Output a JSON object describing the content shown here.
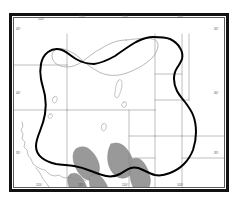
{
  "figure": {
    "kind": "map",
    "title": "",
    "caption": "",
    "projection_note": "western United States regional map",
    "frame": {
      "outer_border_color": "#111111",
      "inner_border_color": "#5a5a5a"
    }
  },
  "map_style": {
    "background": "#ffffff",
    "political_boundary_color": "#8a8a8a",
    "coastline_color": "#8a8a8a",
    "lake_outline_color": "#8a8a8a",
    "study_region_color": "#000000",
    "secondary_region_color": "#9a9a9a",
    "shaded_region_fill": "#999999",
    "shaded_region_stroke": "#7a7a7a"
  },
  "layers": [
    {
      "name": "state-boundaries",
      "label": "State boundaries",
      "style": "thin gray lines"
    },
    {
      "name": "coastline",
      "label": "Coastline",
      "style": "thin gray line"
    },
    {
      "name": "lakes",
      "label": "Lakes",
      "style": "thin gray outlines"
    },
    {
      "name": "study-region-outline",
      "label": "Study region outline",
      "style": "thick black closed curve"
    },
    {
      "name": "secondary-region-outline",
      "label": "Secondary region outline",
      "style": "thin gray closed curve"
    },
    {
      "name": "shaded-regions",
      "label": "Shaded regions",
      "style": "medium gray filled polygons"
    }
  ],
  "axis_labels": {
    "top": [
      {
        "text": "120°",
        "x": 38,
        "y": 18
      },
      {
        "text": "115°",
        "x": 79,
        "y": 16
      },
      {
        "text": "110°",
        "x": 122,
        "y": 16
      },
      {
        "text": "105°",
        "x": 177,
        "y": 16
      }
    ],
    "bottom": [
      {
        "text": "120°",
        "x": 36,
        "y": 184
      },
      {
        "text": "115°",
        "x": 78,
        "y": 184
      },
      {
        "text": "110°",
        "x": 122,
        "y": 184
      },
      {
        "text": "105°",
        "x": 177,
        "y": 184
      }
    ],
    "left": [
      {
        "text": "45°",
        "x": 16,
        "y": 28
      },
      {
        "text": "40°",
        "x": 16,
        "y": 92
      },
      {
        "text": "35°",
        "x": 16,
        "y": 152
      }
    ],
    "right": [
      {
        "text": "45°",
        "x": 214,
        "y": 28
      },
      {
        "text": "40°",
        "x": 214,
        "y": 92
      },
      {
        "text": "35°",
        "x": 214,
        "y": 152
      }
    ]
  },
  "geometry": {
    "state_boundaries": [
      "M 0 47 L 53 47",
      "M 53 47 L 53 16",
      "M 53 47 L 53 92",
      "M 0 92 L 53 92",
      "M 53 92 L 141 92",
      "M 141 16 L 141 92",
      "M 141 92 L 141 118",
      "M 141 118 L 212 118",
      "M 141 118 L 141 171",
      "M 115 118 L 141 118",
      "M 115 92 L 115 171",
      "M 53 92 L 53 171",
      "M 168 16 L 168 118",
      "M 168 118 L 168 171",
      "M 141 56 L 168 56",
      "M 141 82 L 175 82",
      "M 175 82 L 175 16",
      "M 115 140 L 141 140",
      "M 168 140 L 212 140"
    ],
    "coastline": "M 8 104 L 9 108 L 7 112 L 9 116 L 8 121 L 11 124 L 10 129 L 13 132 L 14 137 L 17 141 L 19 146 L 23 149 L 27 151 L 31 152 L 34 155 L 37 157 L 41 158 L 45 157 L 48 159 L 52 160 L 56 159 L 60 161 L 64 162 L 68 161 L 72 163",
    "gulf_line": "M 22 150 L 26 155 L 29 161 L 33 166 L 36 171",
    "lakes": [
      "M 104 63 C 106 60 108 62 108 66 C 108 71 106 76 104 79 C 102 81 100 79 101 74 C 102 69 102 65 104 63 Z",
      "M 110 84 C 112 83 113 85 112 88 C 111 90 109 90 108 88 C 107 86 108 85 110 84 Z",
      "M 40 79 C 42 77 44 79 43 82 C 42 85 40 86 39 84 C 38 82 38 80 40 79 Z",
      "M 36 96 C 38 95 39 97 38 99 C 37 101 35 101 34 99 C 34 97 35 96 36 96 Z",
      "M 89 106 C 91 104 93 106 92 110 C 91 113 89 114 88 112 C 87 109 87 107 89 106 Z"
    ],
    "secondary_region": "M 112 22 C 104 22 96 25 88 30 C 80 34 73 40 68 44 C 63 47 58 49 53 49 C 48 49 44 47 41 45 C 39 43 38 40 38 37 C 38 34 40 32 43 31 C 47 30 51 31 55 33 C 60 35 65 39 69 43 C 74 47 79 51 85 54 C 91 57 98 58 105 57 C 112 56 118 53 124 50 C 130 47 135 43 139 39 C 142 35 144 31 144 27 C 144 24 142 22 139 21 C 134 20 128 20 122 21 C 118 21 115 22 112 22 Z",
    "study_region": "M 139 19 C 134 19 128 21 122 24 C 115 28 108 33 101 38 C 94 42 87 45 80 46 C 73 46 67 44 62 41 C 57 38 53 34 48 32 C 43 30 38 31 34 34 C 30 37 28 41 27 46 C 26 51 26 56 27 61 C 28 67 30 72 31 78 C 32 84 32 90 31 96 C 30 102 28 108 26 113 C 24 118 22 123 22 128 C 22 133 24 137 28 140 C 32 143 37 145 42 146 C 48 147 54 147 60 148 C 66 149 72 151 77 153 C 82 155 87 157 92 158 C 97 159 102 158 106 156 C 110 154 113 151 117 150 C 121 149 125 150 129 152 C 133 154 137 156 141 157 C 146 158 151 157 156 155 C 161 153 166 150 170 146 C 174 142 177 137 179 132 C 181 126 182 120 182 114 C 182 108 181 102 179 97 C 177 92 174 88 171 84 C 168 80 165 77 163 73 C 161 69 160 65 160 61 C 160 57 161 53 163 50 C 165 47 167 44 168 41 C 169 37 168 33 166 30 C 164 26 160 23 156 21 C 151 19 145 19 139 19 Z",
    "shaded_regions": [
      "M 62 131 C 66 128 71 128 75 131 C 79 134 82 138 84 143 C 86 148 86 153 84 157 C 82 161 78 163 74 162 C 70 161 67 158 64 154 C 61 149 59 144 59 139 C 59 135 60 133 62 131 Z",
      "M 97 126 C 102 124 107 125 111 129 C 115 133 118 138 119 144 C 120 150 118 155 115 158 C 111 161 106 161 102 158 C 98 155 95 150 94 144 C 93 138 94 131 97 126 Z",
      "M 119 141 C 123 139 127 141 130 145 C 133 149 135 154 136 159 C 137 164 136 168 134 171 L 120 171 C 118 167 116 162 116 156 C 116 149 117 144 119 141 Z",
      "M 57 156 C 61 154 65 156 68 160 C 71 164 73 169 73 171 L 56 171 C 54 167 53 162 54 159 C 55 157 56 156 57 156 Z",
      "M 78 157 C 82 155 86 157 89 161 C 92 165 94 169 94 171 L 77 171 C 75 167 75 161 76 158 C 77 157 77 157 78 157 Z"
    ]
  }
}
